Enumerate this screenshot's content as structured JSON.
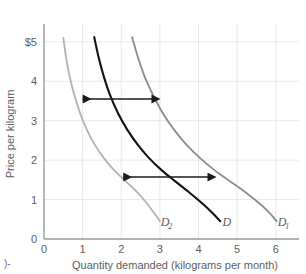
{
  "chart_data": {
    "type": "line",
    "title": "",
    "xlabel": "Quantity demanded (kilograms per month)",
    "ylabel": "Price per kilogram",
    "xlim": [
      0,
      6.6
    ],
    "ylim": [
      0,
      5.35
    ],
    "xticks": [
      "0",
      "1",
      "2",
      "3",
      "4",
      "5",
      "6"
    ],
    "xtick_values": [
      0,
      1,
      2,
      3,
      4,
      5,
      6
    ],
    "yticks": [
      "0",
      "1",
      "2",
      "3",
      "4",
      "$5"
    ],
    "ytick_values": [
      0,
      1,
      2,
      3,
      4,
      5
    ],
    "grid": true,
    "legend": "none",
    "series": [
      {
        "name": "D2",
        "label": "D",
        "sublabel": "2",
        "color": "#b2b2b2",
        "label_x": 3.02,
        "label_y": 0.33,
        "points": [
          [
            0.5,
            5.1
          ],
          [
            0.58,
            4.55
          ],
          [
            0.68,
            4.05
          ],
          [
            0.8,
            3.6
          ],
          [
            0.95,
            3.15
          ],
          [
            1.12,
            2.75
          ],
          [
            1.32,
            2.38
          ],
          [
            1.55,
            2.05
          ],
          [
            1.82,
            1.74
          ],
          [
            2.1,
            1.48
          ],
          [
            2.38,
            1.22
          ],
          [
            2.65,
            0.92
          ],
          [
            2.85,
            0.66
          ],
          [
            3.0,
            0.45
          ]
        ]
      },
      {
        "name": "D",
        "label": "D",
        "sublabel": "",
        "color": "#121212",
        "label_x": 4.62,
        "label_y": 0.33,
        "points": [
          [
            1.3,
            5.12
          ],
          [
            1.42,
            4.58
          ],
          [
            1.56,
            4.08
          ],
          [
            1.72,
            3.62
          ],
          [
            1.92,
            3.18
          ],
          [
            2.15,
            2.78
          ],
          [
            2.42,
            2.4
          ],
          [
            2.72,
            2.05
          ],
          [
            3.05,
            1.74
          ],
          [
            3.4,
            1.46
          ],
          [
            3.76,
            1.18
          ],
          [
            4.1,
            0.9
          ],
          [
            4.38,
            0.64
          ],
          [
            4.56,
            0.45
          ]
        ]
      },
      {
        "name": "D1",
        "label": "D",
        "sublabel": "1",
        "color": "#8d8d8d",
        "label_x": 6.05,
        "label_y": 0.33,
        "points": [
          [
            2.28,
            5.12
          ],
          [
            2.44,
            4.58
          ],
          [
            2.62,
            4.08
          ],
          [
            2.84,
            3.62
          ],
          [
            3.08,
            3.18
          ],
          [
            3.36,
            2.78
          ],
          [
            3.68,
            2.4
          ],
          [
            4.04,
            2.05
          ],
          [
            4.42,
            1.74
          ],
          [
            4.82,
            1.46
          ],
          [
            5.22,
            1.18
          ],
          [
            5.58,
            0.9
          ],
          [
            5.86,
            0.64
          ],
          [
            6.02,
            0.45
          ]
        ]
      }
    ],
    "annotations": [
      {
        "name": "shift-arrow-upper",
        "type": "double-arrow",
        "y": 3.55,
        "x_start": 1.0,
        "x_end": 2.82,
        "color": "#1b1b1b"
      },
      {
        "name": "shift-arrow-lower",
        "type": "double-arrow",
        "y": 1.57,
        "x_start": 2.05,
        "x_end": 4.27,
        "color": "#1b1b1b"
      }
    ],
    "colors": {
      "grid": "#e9e9e9",
      "axis": "#9a9a9a",
      "text": "#5d5d5d",
      "curve_d": "#121212",
      "curve_d1": "#8d8d8d",
      "curve_d2": "#b2b2b2",
      "arrow": "#1b1b1b"
    }
  },
  "artifacts": {
    "bottom_left_mark": ")-"
  }
}
